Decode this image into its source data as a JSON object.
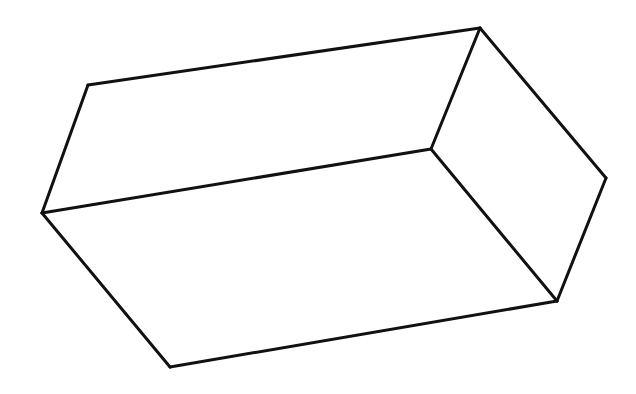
{
  "diagram": {
    "type": "line-drawing",
    "stroke_color": "#111111",
    "background_color": "#ffffff",
    "stroke_width": 3,
    "vertices": {
      "top_left": [
        88,
        85
      ],
      "top_right": [
        480,
        28
      ],
      "left": [
        42,
        213
      ],
      "inner": [
        431,
        149
      ],
      "right": [
        606,
        178
      ],
      "bottom_right": [
        557,
        301
      ],
      "bottom_left": [
        170,
        367
      ]
    },
    "edges": [
      [
        "top_left",
        "top_right"
      ],
      [
        "top_left",
        "left"
      ],
      [
        "top_right",
        "inner"
      ],
      [
        "top_right",
        "right"
      ],
      [
        "left",
        "inner"
      ],
      [
        "inner",
        "bottom_right"
      ],
      [
        "right",
        "bottom_right"
      ],
      [
        "left",
        "bottom_left"
      ],
      [
        "bottom_left",
        "bottom_right"
      ]
    ]
  }
}
